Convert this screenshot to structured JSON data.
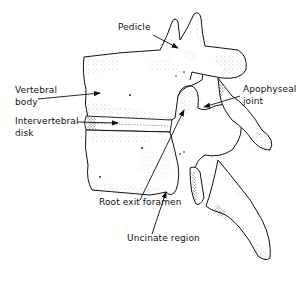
{
  "figure": {
    "labels": {
      "pedicle": "Pedicle",
      "vertebral_body_1": "Vertebral",
      "vertebral_body_2": "body",
      "intervertebral_disk_1": "Intervertebral",
      "intervertebral_disk_2": "disk",
      "apophyseal_joint_1": "Apophyseal",
      "apophyseal_joint_2": "joint",
      "root_exit_foramen": "Root exit foramen",
      "uncinate_region": "Uncinate region"
    },
    "colors": {
      "ink": "#111111",
      "background": "#ffffff",
      "stipple": "#555555"
    }
  }
}
